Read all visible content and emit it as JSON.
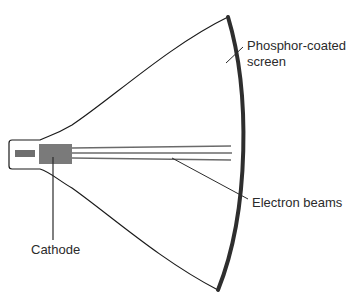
{
  "diagram": {
    "labels": {
      "screen_line1": "Phosphor-coated",
      "screen_line2": "screen",
      "beams": "Electron beams",
      "cathode": "Cathode"
    },
    "colors": {
      "outline": "#1a1a1a",
      "screen": "#2e2e2e",
      "cathode_fill": "#7a7a7a",
      "electrode_fill": "#6e6e6e",
      "beam": "#6a6a6a",
      "leader": "#2b2b2b",
      "text": "#2b2b2b",
      "background": "#ffffff"
    },
    "beam_count": 3
  }
}
